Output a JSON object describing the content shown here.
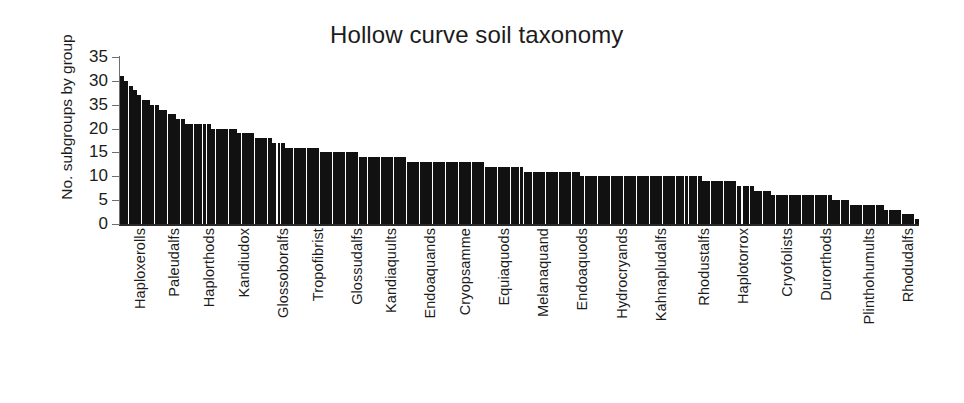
{
  "figure": {
    "title": "Hollow curve soil taxonomy",
    "y_axis_title": "No. subgroups by group",
    "background_color": "#ffffff",
    "bar_color": "#111111",
    "axis_color": "#6e6e6e"
  },
  "chart_data": {
    "type": "bar",
    "title": "Hollow curve soil taxonomy",
    "xlabel": "",
    "ylabel": "No. subgroups by group",
    "ylim": [
      0,
      35
    ],
    "grid": false,
    "legend": null,
    "y_tick_labels": [
      "35",
      "30",
      "35",
      "20",
      "15",
      "10",
      "5",
      "0"
    ],
    "y_tick_values": [
      35,
      30,
      25,
      20,
      15,
      10,
      5,
      0
    ],
    "x_tick_labels": [
      "Haploxerolls",
      "Paleudalfs",
      "Haplorthods",
      "Kandiudox",
      "Glossoboralfs",
      "Tropofibrist",
      "Glossudalfs",
      "Kandiaquults",
      "Endoaquands",
      "Cryopsamme",
      "Equiaquods",
      "Melanaquand",
      "Endoaquods",
      "Hydrocryands",
      "Kahnapludalfs",
      "Rhodustalfs",
      "Haplotorrox",
      "Cryofolists",
      "Durorthods",
      "Plinthohumults",
      "Rhodudalfs"
    ],
    "x_tick_positions": [
      1,
      9,
      17,
      25,
      34,
      42,
      51,
      59,
      68,
      76,
      85,
      94,
      103,
      112,
      121,
      131,
      140,
      150,
      159,
      169,
      178
    ],
    "n_bars": 184,
    "values": [
      31,
      30,
      29,
      28,
      27,
      26,
      26,
      25,
      25,
      24,
      24,
      23,
      23,
      22,
      22,
      21,
      21,
      21,
      21,
      21,
      21,
      20,
      20,
      20,
      20,
      20,
      20,
      19,
      19,
      19,
      19,
      18,
      18,
      18,
      18,
      17,
      17,
      17,
      16,
      16,
      16,
      16,
      16,
      16,
      16,
      16,
      15,
      15,
      15,
      15,
      15,
      15,
      15,
      15,
      15,
      14,
      14,
      14,
      14,
      14,
      14,
      14,
      14,
      14,
      14,
      14,
      13,
      13,
      13,
      13,
      13,
      13,
      13,
      13,
      13,
      13,
      13,
      13,
      13,
      13,
      13,
      13,
      13,
      13,
      12,
      12,
      12,
      12,
      12,
      12,
      12,
      12,
      12,
      11,
      11,
      11,
      11,
      11,
      11,
      11,
      11,
      11,
      11,
      11,
      11,
      11,
      10,
      10,
      10,
      10,
      10,
      10,
      10,
      10,
      10,
      10,
      10,
      10,
      10,
      10,
      10,
      10,
      10,
      10,
      10,
      10,
      10,
      10,
      10,
      10,
      10,
      10,
      10,
      10,
      9,
      9,
      9,
      9,
      9,
      9,
      9,
      9,
      8,
      8,
      8,
      8,
      7,
      7,
      7,
      7,
      6,
      6,
      6,
      6,
      6,
      6,
      6,
      6,
      6,
      6,
      6,
      6,
      6,
      6,
      5,
      5,
      5,
      5,
      4,
      4,
      4,
      4,
      4,
      4,
      4,
      4,
      3,
      3,
      3,
      3,
      2,
      2,
      2,
      1
    ],
    "separator_bar_indices": [
      36,
      143
    ]
  }
}
